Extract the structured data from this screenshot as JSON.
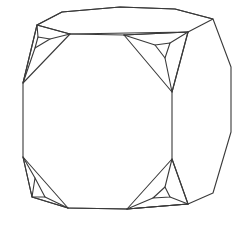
{
  "figure": {
    "background": "#ffffff",
    "stroke_color": "#3a3a3a",
    "stroke_width": 1.1,
    "outline": [
      [
        62,
        12
      ],
      [
        120,
        7
      ],
      [
        175,
        9
      ],
      [
        213,
        19
      ],
      [
        231,
        67
      ],
      [
        231,
        132
      ],
      [
        213,
        193
      ],
      [
        188,
        204
      ],
      [
        127,
        209
      ],
      [
        68,
        208
      ],
      [
        32,
        197
      ],
      [
        23,
        157
      ],
      [
        23,
        83
      ],
      [
        37,
        25
      ]
    ],
    "top_face": [
      [
        37,
        25
      ],
      [
        62,
        12
      ],
      [
        120,
        7
      ],
      [
        175,
        9
      ],
      [
        213,
        19
      ],
      [
        188,
        32
      ],
      [
        70,
        34
      ]
    ],
    "right_face_edge": [
      [
        188,
        32
      ],
      [
        172,
        92
      ],
      [
        172,
        159
      ],
      [
        188,
        204
      ]
    ],
    "front_edges": [
      [
        [
          70,
          34
        ],
        [
          124,
          35
        ]
      ],
      [
        [
          124,
          35
        ],
        [
          188,
          32
        ]
      ],
      [
        [
          68,
          208
        ],
        [
          127,
          209
        ]
      ],
      [
        [
          127,
          209
        ],
        [
          188,
          204
        ]
      ]
    ],
    "corners": [
      {
        "name": "top-left",
        "outer": [
          [
            37,
            25
          ],
          [
            70,
            34
          ],
          [
            23,
            83
          ]
        ],
        "inner": [
          [
            38,
            37
          ],
          [
            50,
            39
          ],
          [
            35,
            48
          ]
        ],
        "spokes": [
          [
            [
              37,
              25
            ],
            [
              38,
              37
            ]
          ],
          [
            [
              70,
              34
            ],
            [
              50,
              39
            ]
          ],
          [
            [
              23,
              83
            ],
            [
              35,
              48
            ]
          ]
        ]
      },
      {
        "name": "top-right",
        "outer": [
          [
            124,
            35
          ],
          [
            188,
            32
          ],
          [
            172,
            92
          ]
        ],
        "inner": [
          [
            155,
            45
          ],
          [
            170,
            43
          ],
          [
            165,
            58
          ]
        ],
        "spokes": [
          [
            [
              124,
              35
            ],
            [
              155,
              45
            ]
          ],
          [
            [
              188,
              32
            ],
            [
              170,
              43
            ]
          ],
          [
            [
              172,
              92
            ],
            [
              165,
              58
            ]
          ]
        ]
      },
      {
        "name": "bottom-left",
        "outer": [
          [
            23,
            157
          ],
          [
            68,
            208
          ],
          [
            32,
            197
          ]
        ],
        "inner": [
          [
            35,
            178
          ],
          [
            45,
            197
          ],
          [
            32,
            197
          ]
        ],
        "spokes": [
          [
            [
              23,
              157
            ],
            [
              35,
              178
            ]
          ],
          [
            [
              68,
              208
            ],
            [
              45,
              197
            ]
          ]
        ]
      },
      {
        "name": "bottom-right",
        "outer": [
          [
            172,
            159
          ],
          [
            188,
            204
          ],
          [
            127,
            209
          ]
        ],
        "inner": [
          [
            165,
            187
          ],
          [
            170,
            197
          ],
          [
            153,
            198
          ]
        ],
        "spokes": [
          [
            [
              172,
              159
            ],
            [
              165,
              187
            ]
          ],
          [
            [
              188,
              204
            ],
            [
              170,
              197
            ]
          ],
          [
            [
              127,
              209
            ],
            [
              153,
              198
            ]
          ]
        ]
      }
    ]
  }
}
